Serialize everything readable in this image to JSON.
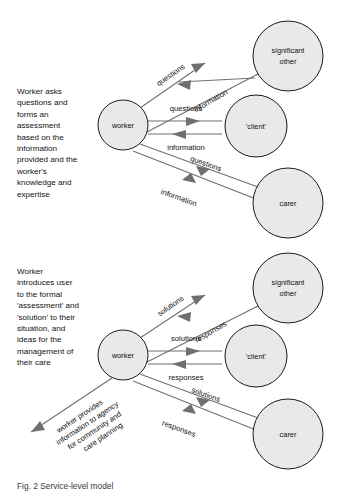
{
  "figure": {
    "caption": "Fig. 2  Service-level model",
    "panels": [
      {
        "id": "panel-one",
        "description": "Worker asks\nquestions and\nforms an\nassessment\nbased on the\ninformation\nprovided and the\nworker's\nknowledge and\nexpertise",
        "nodes": {
          "worker": "worker",
          "significant_other": "significant\nother",
          "significant_other_line1": "significant",
          "significant_other_line2": "other",
          "client": "'client'",
          "carer": "carer"
        },
        "edges": [
          {
            "from": "worker",
            "to": "significant_other",
            "label": "questions",
            "direction": "outbound"
          },
          {
            "from": "significant_other",
            "to": "worker",
            "label": "information",
            "direction": "inbound"
          },
          {
            "from": "worker",
            "to": "client",
            "label": "questions",
            "direction": "outbound"
          },
          {
            "from": "client",
            "to": "worker",
            "label": "information",
            "direction": "inbound"
          },
          {
            "from": "worker",
            "to": "carer",
            "label": "questions",
            "direction": "outbound"
          },
          {
            "from": "carer",
            "to": "worker",
            "label": "information",
            "direction": "inbound"
          }
        ]
      },
      {
        "id": "panel-two",
        "description": "Worker\nintroduces user\nto the formal\n'assessment' and\n'solution' to their\nsituation, and\nideas for the\nmanagement of\ntheir care",
        "nodes": {
          "worker": "worker",
          "significant_other": "significant\nother",
          "significant_other_line1": "significant",
          "significant_other_line2": "other",
          "client": "'client'",
          "carer": "carer"
        },
        "edges": [
          {
            "from": "worker",
            "to": "significant_other",
            "label": "solutions",
            "direction": "outbound"
          },
          {
            "from": "significant_other",
            "to": "worker",
            "label": "responses",
            "direction": "inbound"
          },
          {
            "from": "worker",
            "to": "client",
            "label": "solutions",
            "direction": "outbound"
          },
          {
            "from": "client",
            "to": "worker",
            "label": "responses",
            "direction": "inbound"
          },
          {
            "from": "worker",
            "to": "carer",
            "label": "solutions",
            "direction": "outbound"
          },
          {
            "from": "carer",
            "to": "worker",
            "label": "responses",
            "direction": "inbound"
          }
        ],
        "agency_arrow": {
          "line1": "worker provides",
          "line2": "information to agency",
          "line3": "for community and",
          "line4": "care planning"
        }
      }
    ]
  },
  "colors": {
    "node_fill": "#e9e9e9",
    "node_stroke": "#1a1a1a",
    "edge": "#6f6f6f",
    "text": "#111111",
    "background": "#ffffff"
  }
}
